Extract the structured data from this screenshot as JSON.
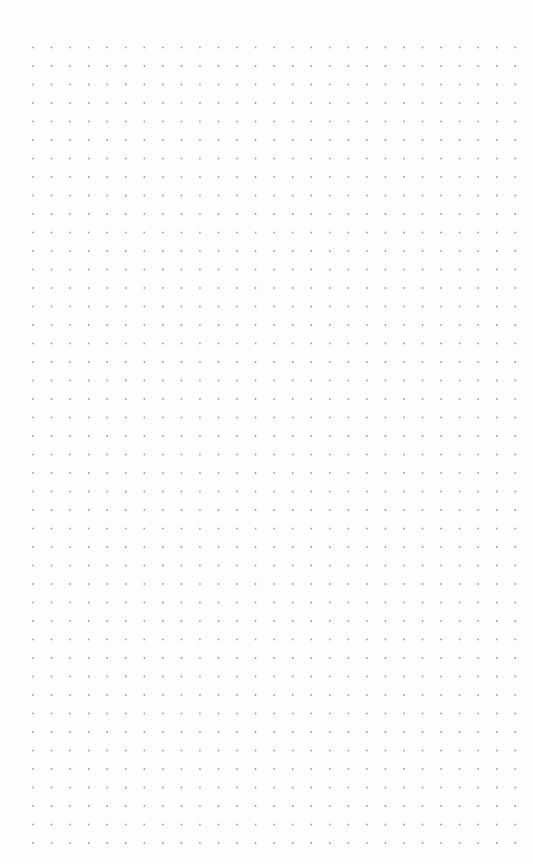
{
  "canvas": {
    "background_color": "#fdfdfd",
    "grid": {
      "type": "dots",
      "dot_color": "#9c9c9c",
      "dot_radius": 0.9,
      "spacing_x": 18.55,
      "spacing_y": 18.5,
      "origin_x": 33,
      "origin_y": 47.5,
      "columns": 27,
      "rows": 44
    }
  }
}
